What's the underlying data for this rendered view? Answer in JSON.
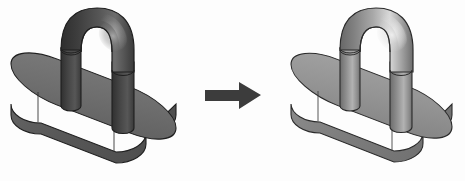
{
  "scene": {
    "title": "CAD model shading comparison",
    "background_color": "#fdfdfd",
    "width": 465,
    "height": 181,
    "description": "Two isometric views of the same CAD part (an oval base plate with a U-shaped handle) shown before and after a shading / material change, separated by a right-pointing block arrow."
  },
  "left_object": {
    "name": "Oval base plate with U-handle (dark matte shading)",
    "colors": {
      "base_top": "#6f6f6f",
      "base_side_front": "#595959",
      "base_side_left": "#616161",
      "base_outline": "#1f1f1f",
      "handle_dark": "#3a3a3a",
      "handle_mid": "#555555",
      "handle_highlight": "#9a9a9a",
      "leg_left": "#4a4a4a",
      "leg_right": "#4f4f4f"
    },
    "bounds": {
      "x": 8,
      "y": 6,
      "width": 172,
      "height": 152
    }
  },
  "arrow": {
    "name": "transform-arrow",
    "direction": "right",
    "color": "#3c3c3c",
    "bounds": {
      "x": 205,
      "y": 82,
      "width": 56,
      "height": 28
    }
  },
  "right_object": {
    "name": "Oval base plate with U-handle (light metallic shading)",
    "colors": {
      "base_top": "#949494",
      "base_side_front": "#7c7c7c",
      "base_side_left": "#868686",
      "base_outline": "#2a2a2a",
      "handle_dark": "#6a6a6a",
      "handle_mid": "#8c8c8c",
      "handle_highlight": "#e2e2e2",
      "leg_left": "#878787",
      "leg_right": "#8e8e8e"
    },
    "bounds": {
      "x": 288,
      "y": 6,
      "width": 168,
      "height": 150
    }
  }
}
